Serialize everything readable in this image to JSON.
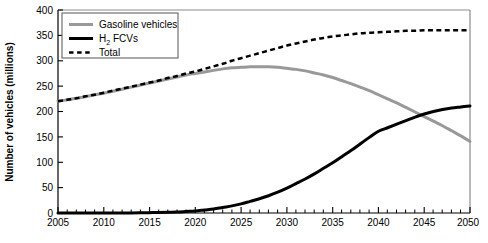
{
  "chart_data": {
    "type": "line",
    "title": "",
    "xlabel": "",
    "ylabel": "Number of vehicles (millions)",
    "xlim": [
      2005,
      2050
    ],
    "ylim": [
      0,
      400
    ],
    "x_ticks": [
      2005,
      2010,
      2015,
      2020,
      2025,
      2030,
      2035,
      2040,
      2045,
      2050
    ],
    "x_tick_labels": [
      "2005",
      "2010",
      "2015",
      "2020",
      "2025",
      "2030",
      "2035",
      "2040",
      "2045",
      "2050"
    ],
    "x_minor_tick_step": 1,
    "y_ticks": [
      0,
      50,
      100,
      150,
      200,
      250,
      300,
      350,
      400
    ],
    "y_tick_labels": [
      "0",
      "50",
      "100",
      "150",
      "200",
      "250",
      "300",
      "350",
      "400"
    ],
    "grid": false,
    "legend_position": "upper left",
    "x": [
      2005,
      2006,
      2007,
      2008,
      2009,
      2010,
      2011,
      2012,
      2013,
      2014,
      2015,
      2016,
      2017,
      2018,
      2019,
      2020,
      2021,
      2022,
      2023,
      2024,
      2025,
      2026,
      2027,
      2028,
      2029,
      2030,
      2031,
      2032,
      2033,
      2034,
      2035,
      2036,
      2037,
      2038,
      2039,
      2040,
      2041,
      2042,
      2043,
      2044,
      2045,
      2046,
      2047,
      2048,
      2049,
      2050
    ],
    "series": [
      {
        "name": "Gasoline vehicles",
        "color": "#999999",
        "style": "solid",
        "width": 3,
        "values": [
          220,
          223,
          226,
          229,
          233,
          236,
          240,
          244,
          248,
          252,
          256,
          260,
          264,
          268,
          272,
          275,
          278,
          281,
          284,
          286,
          287,
          288,
          288,
          288,
          287,
          285,
          283,
          280,
          276,
          272,
          267,
          261,
          255,
          248,
          241,
          233,
          225,
          217,
          208,
          199,
          190,
          181,
          172,
          162,
          152,
          141
        ]
      },
      {
        "name": "H2 FCVs",
        "label_main": "H",
        "label_sub": "2",
        "label_rest": " FCVs",
        "color": "#000000",
        "style": "solid",
        "width": 3,
        "values": [
          0,
          0,
          0,
          0,
          0,
          0,
          0,
          0,
          0.2,
          0.4,
          0.7,
          1,
          1.5,
          2,
          3,
          4,
          6,
          8,
          11,
          14,
          18,
          23,
          28,
          34,
          41,
          49,
          58,
          67,
          77,
          88,
          99,
          111,
          123,
          136,
          149,
          161,
          168,
          175,
          182,
          189,
          195,
          200,
          204,
          207,
          209,
          211
        ]
      },
      {
        "name": "Total",
        "color": "#000000",
        "style": "dashed",
        "width": 2.5,
        "values": [
          220,
          223,
          226,
          230,
          233,
          237,
          241,
          245,
          249,
          253,
          257,
          261,
          266,
          270,
          275,
          279,
          284,
          289,
          294,
          300,
          305,
          310,
          315,
          320,
          325,
          330,
          334,
          338,
          342,
          345,
          348,
          350,
          352,
          354,
          355,
          356,
          357,
          358,
          359,
          359,
          360,
          360,
          360,
          360,
          360,
          360
        ]
      }
    ],
    "annotations": {
      "gasoline_peak_year": 2027,
      "gasoline_peak_value": 288,
      "crossover_year": 2046,
      "crossover_value": 171
    }
  },
  "legend": {
    "items": [
      {
        "label": "Gasoline vehicles",
        "swatch": "gasoline-line-swatch"
      },
      {
        "label": "H2 FCVs",
        "swatch": "h2fcv-line-swatch"
      },
      {
        "label": "Total",
        "swatch": "total-line-swatch"
      }
    ]
  }
}
